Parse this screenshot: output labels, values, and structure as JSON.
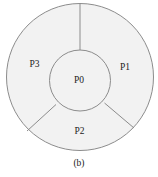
{
  "diagram": {
    "type": "partitioned-ring",
    "caption": "(b)",
    "colors": {
      "fill": "#f2f2f2",
      "stroke": "#8c8c8c",
      "text": "#222222"
    },
    "regions": [
      {
        "id": "P0",
        "label": "P0",
        "position": "center"
      },
      {
        "id": "P1",
        "label": "P1",
        "position": "outer-right"
      },
      {
        "id": "P2",
        "label": "P2",
        "position": "outer-bottom"
      },
      {
        "id": "P3",
        "label": "P3",
        "position": "outer-left"
      }
    ]
  }
}
